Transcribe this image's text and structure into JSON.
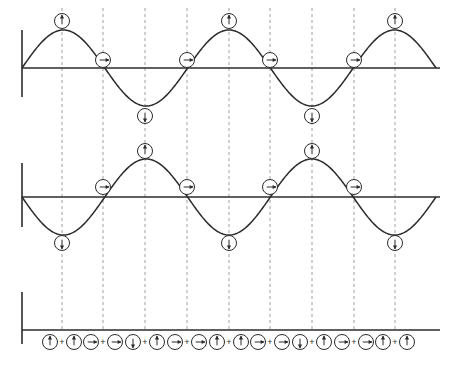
{
  "figure": {
    "background_color": "#ffffff",
    "wave_color": "#2b2b2b",
    "grid_color": "#9aa0a6",
    "axis_color": "#2b2b2b"
  },
  "layout": {
    "width": 456,
    "height": 374,
    "axis_x_start": 22,
    "axis_x_left": 22,
    "axis_x_end": 440,
    "wave_x_start": 22,
    "wave_x_end": 436,
    "panels": [
      {
        "name": "wave-top",
        "baseline_y": 68,
        "amplitude": 38,
        "vertical_bar_top": 30,
        "vertical_bar_bottom": 97
      },
      {
        "name": "wave-middle",
        "baseline_y": 197,
        "amplitude": 38,
        "vertical_bar_top": 163,
        "vertical_bar_bottom": 227
      },
      {
        "name": "sum-row",
        "baseline_y": 330,
        "amplitude": 0,
        "vertical_bar_top": 292,
        "vertical_bar_bottom": 344
      }
    ],
    "gridlines_x": [
      62,
      103,
      145,
      187,
      229,
      270,
      312,
      354,
      395
    ],
    "gridline_top": 8,
    "gridline_bottom": 330
  },
  "chart_data": {
    "type": "line",
    "xlabel": "",
    "ylabel": "",
    "grid": true,
    "legend_position": "none",
    "x_unit": "quarter period",
    "x": [
      0,
      1,
      2,
      3,
      4,
      5,
      6,
      7,
      8,
      9,
      10
    ],
    "series": [
      {
        "name": "wave-top",
        "description": "positive sine, three full cycles minus an end segment",
        "function": "sin",
        "phase_deg": 0,
        "amplitude": 1,
        "cycles": 2.5,
        "values": [
          0,
          1,
          0,
          -1,
          0,
          1,
          0,
          -1,
          0,
          1,
          0
        ]
      },
      {
        "name": "wave-middle",
        "description": "negative sine (inverted), same wavelength",
        "function": "-sin",
        "phase_deg": 180,
        "amplitude": 1,
        "cycles": 2.5,
        "values": [
          0,
          -1,
          0,
          1,
          0,
          -1,
          0,
          1,
          0,
          -1,
          0
        ]
      }
    ]
  },
  "markers": {
    "legend": {
      "up": "arrow-up-in-circle",
      "down": "arrow-down-in-circle",
      "right": "arrow-right-in-circle"
    },
    "wave_top": [
      {
        "x": 62,
        "y": 21,
        "direction": "up",
        "name": "marker-up"
      },
      {
        "x": 103,
        "y": 60,
        "direction": "right",
        "name": "marker-right"
      },
      {
        "x": 145,
        "y": 116,
        "direction": "down",
        "name": "marker-down"
      },
      {
        "x": 187,
        "y": 60,
        "direction": "right",
        "name": "marker-right"
      },
      {
        "x": 229,
        "y": 21,
        "direction": "up",
        "name": "marker-up"
      },
      {
        "x": 270,
        "y": 60,
        "direction": "right",
        "name": "marker-right"
      },
      {
        "x": 312,
        "y": 116,
        "direction": "down",
        "name": "marker-down"
      },
      {
        "x": 354,
        "y": 60,
        "direction": "right",
        "name": "marker-right"
      },
      {
        "x": 395,
        "y": 21,
        "direction": "up",
        "name": "marker-up"
      }
    ],
    "wave_middle": [
      {
        "x": 62,
        "y": 243,
        "direction": "down",
        "name": "marker-down"
      },
      {
        "x": 103,
        "y": 187,
        "direction": "right",
        "name": "marker-right"
      },
      {
        "x": 145,
        "y": 151,
        "direction": "up",
        "name": "marker-up"
      },
      {
        "x": 187,
        "y": 187,
        "direction": "right",
        "name": "marker-right"
      },
      {
        "x": 229,
        "y": 243,
        "direction": "down",
        "name": "marker-down"
      },
      {
        "x": 270,
        "y": 187,
        "direction": "right",
        "name": "marker-right"
      },
      {
        "x": 312,
        "y": 151,
        "direction": "up",
        "name": "marker-up"
      },
      {
        "x": 354,
        "y": 187,
        "direction": "right",
        "name": "marker-right"
      },
      {
        "x": 395,
        "y": 243,
        "direction": "down",
        "name": "marker-down"
      }
    ],
    "sum_row": [
      {
        "x": 62,
        "left": "up",
        "right": "up",
        "operator": "+"
      },
      {
        "x": 103,
        "left": "right",
        "right": "right",
        "operator": "+"
      },
      {
        "x": 145,
        "left": "down",
        "right": "up",
        "operator": "+"
      },
      {
        "x": 187,
        "left": "right",
        "right": "right",
        "operator": "+"
      },
      {
        "x": 229,
        "left": "up",
        "right": "up",
        "operator": "+"
      },
      {
        "x": 270,
        "left": "right",
        "right": "right",
        "operator": "+"
      },
      {
        "x": 312,
        "left": "down",
        "right": "up",
        "operator": "+"
      },
      {
        "x": 354,
        "left": "right",
        "right": "right",
        "operator": "+"
      },
      {
        "x": 395,
        "left": "up",
        "right": "up",
        "operator": "+"
      }
    ],
    "radius": 7.5,
    "pair_offset": 12,
    "operator_symbol": "+"
  }
}
